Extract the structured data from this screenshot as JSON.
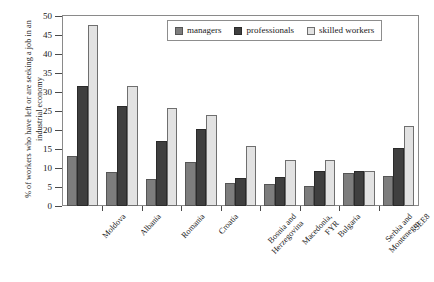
{
  "chart_data": {
    "type": "bar",
    "title": "",
    "xlabel": "",
    "ylabel": "% of workers who have left or are seeking a job in an industrial economy",
    "ylim": [
      0,
      50
    ],
    "yticks": [
      0,
      5,
      10,
      15,
      20,
      25,
      30,
      35,
      40,
      45,
      50
    ],
    "grid": false,
    "legend_position": "top-center",
    "categories": [
      "Moldova",
      "Albania",
      "Romania",
      "Croatia",
      "Bosnia and\nHerzegovina",
      "Macedonia,\nFYR",
      "Bulgaria",
      "Serbia and\nMontenegro",
      "SEE8"
    ],
    "series": [
      {
        "name": "managers",
        "color": "#7d7d7d",
        "values": [
          13.2,
          9.0,
          7.0,
          11.5,
          6.1,
          5.7,
          5.3,
          8.6,
          8.0
        ]
      },
      {
        "name": "professionals",
        "color": "#3f3f3f",
        "values": [
          31.6,
          26.4,
          17.0,
          20.3,
          7.4,
          7.7,
          9.2,
          9.2,
          15.3
        ]
      },
      {
        "name": "skilled workers",
        "color": "#e2e2e2",
        "values": [
          47.6,
          31.7,
          25.8,
          23.9,
          15.8,
          12.2,
          12.1,
          9.3,
          21.1
        ]
      }
    ]
  }
}
